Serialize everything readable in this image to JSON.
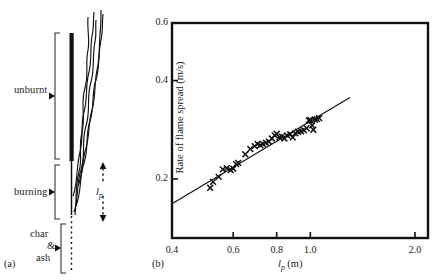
{
  "figure": {
    "panel_a": {
      "caption": "(a)",
      "zone_labels": [
        {
          "name": "unburnt",
          "text": "unburnt"
        },
        {
          "name": "burning",
          "text": "burning"
        },
        {
          "name": "char",
          "text": "char"
        },
        {
          "name": "ampersand",
          "text": "&"
        },
        {
          "name": "ash",
          "text": "ash"
        }
      ],
      "dimension_label": {
        "symbol": "l",
        "subscript": "p"
      }
    },
    "panel_b": {
      "caption": "(b)"
    }
  },
  "chart_data": {
    "type": "scatter",
    "title": "",
    "xlabel": "l_p (m)",
    "xlabel_symbol": "l",
    "xlabel_subscript": "p",
    "xlabel_unit": "(m)",
    "ylabel": "Rate of flame spread (m/s)",
    "xscale": "log",
    "yscale": "log",
    "xlim": [
      0.4,
      2.18
    ],
    "ylim": [
      0.132,
      0.6
    ],
    "xticks": [
      0.4,
      0.6,
      0.8,
      1.0,
      2.0
    ],
    "xticklabels": [
      "0.4",
      "0.6",
      "0.8",
      "1.0",
      "2.0"
    ],
    "yticks": [
      0.2,
      0.4,
      0.6
    ],
    "yticklabels": [
      "0.2",
      "0.4",
      "0.6"
    ],
    "grid": false,
    "legend": null,
    "marker": "x",
    "series": [
      {
        "name": "measured flame spread",
        "x": [
          0.515,
          0.525,
          0.545,
          0.56,
          0.575,
          0.59,
          0.6,
          0.612,
          0.62,
          0.65,
          0.672,
          0.692,
          0.705,
          0.718,
          0.73,
          0.745,
          0.76,
          0.775,
          0.79,
          0.8,
          0.815,
          0.828,
          0.842,
          0.858,
          0.875,
          0.89,
          0.905,
          0.922,
          0.94,
          0.958,
          0.975,
          0.99,
          1.0,
          1.012,
          1.02,
          1.03,
          1.045,
          1.06
        ],
        "y": [
          0.188,
          0.196,
          0.203,
          0.214,
          0.216,
          0.213,
          0.215,
          0.222,
          0.224,
          0.238,
          0.247,
          0.252,
          0.256,
          0.254,
          0.256,
          0.258,
          0.26,
          0.266,
          0.272,
          0.275,
          0.268,
          0.27,
          0.266,
          0.272,
          0.274,
          0.268,
          0.276,
          0.279,
          0.28,
          0.282,
          0.286,
          0.302,
          0.303,
          0.292,
          0.283,
          0.304,
          0.305,
          0.307
        ]
      }
    ],
    "fit_line": {
      "name": "best-fit line",
      "x": [
        0.4,
        1.3
      ],
      "y": [
        0.168,
        0.355
      ]
    }
  }
}
